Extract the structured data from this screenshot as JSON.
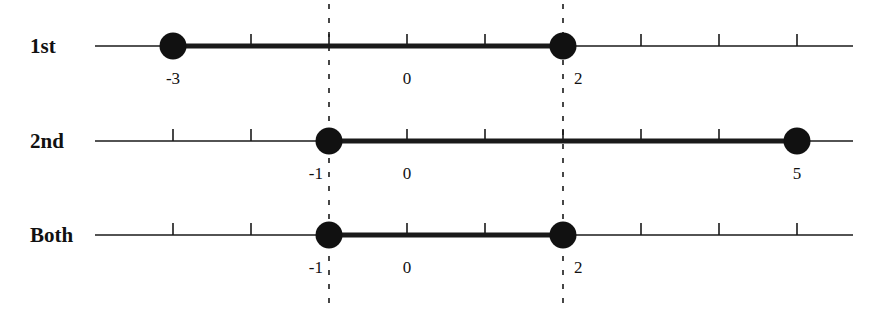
{
  "axis": {
    "x_start_px": 95,
    "x_end_px": 853,
    "origin_px": 407,
    "unit_px": 78,
    "tick_values": [
      -3,
      -2,
      -1,
      0,
      1,
      2,
      3,
      4,
      5
    ]
  },
  "dashed_guides": [
    {
      "value": -1,
      "label": "x = -1"
    },
    {
      "value": 2,
      "label": "x = 2"
    }
  ],
  "rows": [
    {
      "label": "1st",
      "y_px": 46,
      "interval": {
        "from": -3,
        "to": 2
      },
      "endpoint_labels": [
        {
          "value": -3,
          "text": "-3"
        },
        {
          "value": 0,
          "text": "0"
        },
        {
          "value": 2,
          "text": "2"
        }
      ]
    },
    {
      "label": "2nd",
      "y_px": 141,
      "interval": {
        "from": -1,
        "to": 5
      },
      "endpoint_labels": [
        {
          "value": -1,
          "text": "-1"
        },
        {
          "value": 0,
          "text": "0"
        },
        {
          "value": 5,
          "text": "5"
        }
      ]
    },
    {
      "label": "Both",
      "y_px": 235,
      "interval": {
        "from": -1,
        "to": 2
      },
      "endpoint_labels": [
        {
          "value": -1,
          "text": "-1"
        },
        {
          "value": 0,
          "text": "0"
        },
        {
          "value": 2,
          "text": "2"
        }
      ]
    }
  ],
  "colors": {
    "line": "#1a1a1a",
    "dot": "#111111",
    "background": "#ffffff"
  }
}
